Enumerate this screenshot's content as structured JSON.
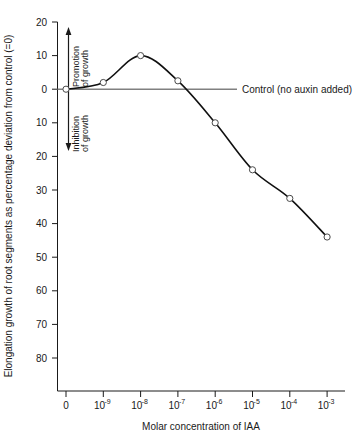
{
  "chart_data": {
    "type": "line",
    "title": "",
    "xlabel": "Molar concentration of IAA",
    "ylabel": "Elongation growth of root segments as percentage deviation from control (=0)",
    "x_tick_labels": [
      "0",
      "10",
      "10",
      "10",
      "10",
      "10",
      "10",
      "10"
    ],
    "x_tick_exponents": [
      "",
      "-9",
      "-8",
      "-7",
      "-6",
      "-5",
      "-4",
      "-3"
    ],
    "x_categories": [
      "0",
      "10^-9",
      "10^-8",
      "10^-7",
      "10^-6",
      "10^-5",
      "10^-4",
      "10^-3"
    ],
    "y_tick_labels": [
      "20",
      "10",
      "0",
      "10",
      "20",
      "30",
      "40",
      "50",
      "60",
      "70",
      "80"
    ],
    "y_tick_values": [
      20,
      10,
      0,
      -10,
      -20,
      -30,
      -40,
      -50,
      -60,
      -70,
      -80
    ],
    "ylim": [
      -80,
      20
    ],
    "grid": false,
    "legend_position": "inline-right",
    "values": [
      0,
      2,
      10,
      2.5,
      -10,
      -24,
      -32.5,
      -44
    ],
    "series": [
      {
        "name": "Elongation growth deviation",
        "values": [
          0,
          2,
          10,
          2.5,
          -10,
          -24,
          -32.5,
          -44
        ]
      }
    ],
    "points": [
      {
        "x": "0",
        "y": 0
      },
      {
        "x": "10^-9",
        "y": 2
      },
      {
        "x": "10^-8",
        "y": 10
      },
      {
        "x": "10^-7",
        "y": 2.5
      },
      {
        "x": "10^-6",
        "y": -10
      },
      {
        "x": "10^-5",
        "y": -24
      },
      {
        "x": "10^-4",
        "y": -32.5
      },
      {
        "x": "10^-3",
        "y": -44
      }
    ],
    "annotations": [
      {
        "name": "control-line-label",
        "text": "Control (no auxin added)",
        "y": 0
      },
      {
        "name": "promotion-arrow-label",
        "text": "Promotion of growth",
        "direction": "up"
      },
      {
        "name": "inhibition-arrow-label",
        "text": "Inhibition of growth",
        "direction": "down"
      }
    ],
    "colors": {
      "curve": "#101010",
      "axis": "#1a1a1a",
      "control_line": "#808080",
      "marker_fill": "#ffffff",
      "marker_stroke": "#4a4a4a",
      "background": "#ffffff"
    }
  },
  "annotations": {
    "promotion_line1": "Promotion",
    "promotion_line2": "of growth",
    "inhibition_line1": "Inhibition",
    "inhibition_line2": "of growth",
    "control_label": "Control (no auxin added)"
  },
  "axes": {
    "x_title": "Molar concentration of IAA",
    "y_title": "Elongation growth of root segments as percentage deviation from control (=0)"
  },
  "ticks": {
    "y": [
      "20",
      "10",
      "0",
      "10",
      "20",
      "30",
      "40",
      "50",
      "60",
      "70",
      "80"
    ],
    "x_mantissa": [
      "0",
      "10",
      "10",
      "10",
      "10",
      "10",
      "10",
      "10"
    ],
    "x_exponent": [
      "",
      "-9",
      "-8",
      "-7",
      "-6",
      "-5",
      "-4",
      "-3"
    ]
  }
}
